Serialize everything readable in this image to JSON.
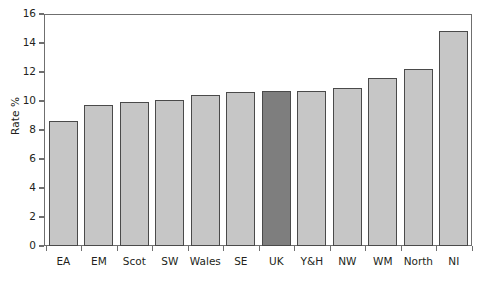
{
  "chart_data": {
    "type": "bar",
    "title": "",
    "xlabel": "",
    "ylabel": "Rate %",
    "ylim": [
      0,
      16
    ],
    "yticks": [
      0,
      2,
      4,
      6,
      8,
      10,
      12,
      14,
      16
    ],
    "ytick_labels": [
      "0",
      "2",
      "4",
      "6",
      "8",
      "10",
      "12",
      "14",
      "16"
    ],
    "grid": false,
    "legend": "none",
    "categories": [
      "EA",
      "EM",
      "Scot",
      "SW",
      "Wales",
      "SE",
      "UK",
      "Y&H",
      "NW",
      "WM",
      "North",
      "NI"
    ],
    "values": [
      8.6,
      9.7,
      9.9,
      10.1,
      10.4,
      10.6,
      10.7,
      10.7,
      10.9,
      11.6,
      12.2,
      14.8
    ],
    "highlight_category": "UK",
    "colors": {
      "bar_fill": "#c6c6c6",
      "bar_highlight_fill": "#7e7e7e",
      "bar_stroke": "#4a4a4a",
      "axis": "#6f6f6f",
      "text": "#231f20",
      "background": "#ffffff"
    }
  }
}
